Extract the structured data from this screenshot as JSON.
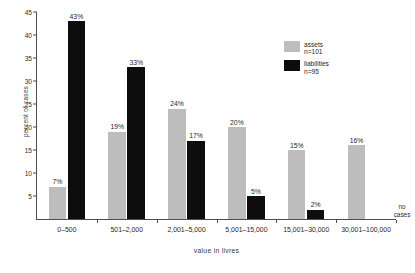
{
  "chart_data": {
    "type": "bar",
    "title": "",
    "subtitle": "",
    "xlabel": "value in livres",
    "ylabel": "percent of cases",
    "categories": [
      "0–500",
      "501–2,000",
      "2,001–5,000",
      "5,001–15,000",
      "15,001–30,000",
      "30,001–100,000"
    ],
    "series": [
      {
        "name": "assets",
        "legend_label": "assets",
        "legend_n": "n=101",
        "color": "#bdbdbd",
        "values": [
          7,
          19,
          24,
          20,
          15,
          16
        ],
        "data_labels": [
          "7%",
          "19%",
          "24%",
          "20%",
          "15%",
          "16%"
        ]
      },
      {
        "name": "liabilities",
        "legend_label": "liabilities",
        "legend_n": "n=95",
        "color": "#0d0d0d",
        "values": [
          43,
          33,
          17,
          5,
          2,
          null
        ],
        "data_labels": [
          "43%",
          "33%",
          "17%",
          "5%",
          "2%",
          ""
        ]
      }
    ],
    "ylim": [
      0,
      45
    ],
    "ytick_values": [
      5,
      10,
      15,
      20,
      25,
      30,
      35,
      40,
      45
    ],
    "ytick_labels": [
      "5",
      "10",
      "15",
      "20",
      "25",
      "30",
      "35",
      "40",
      "45"
    ],
    "grid": false,
    "legend_position": "top-right",
    "annotations": [
      {
        "text_line_1": "no",
        "text_line_2": "cases",
        "attached_to_category": "30,001–100,000",
        "attached_to_series": "liabilities"
      }
    ]
  }
}
